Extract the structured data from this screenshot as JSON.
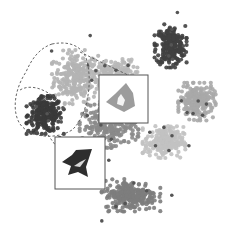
{
  "chart_data": {
    "type": "scatter",
    "title": "",
    "xlabel": "",
    "ylabel": "",
    "axes_visible": false,
    "grid": false,
    "legend": "none",
    "xlim": [
      0,
      100
    ],
    "ylim": [
      0,
      100
    ],
    "series": [
      {
        "name": "cluster-light-upper-left",
        "color": "#b4b4b4",
        "center": [
          30,
          69
        ],
        "spread": [
          9,
          10
        ],
        "count": 260
      },
      {
        "name": "cluster-dark-left",
        "color": "#3a3a3a",
        "center": [
          16,
          52
        ],
        "spread": [
          7,
          7
        ],
        "count": 240
      },
      {
        "name": "cluster-dark-top-right",
        "color": "#404040",
        "center": [
          73,
          83
        ],
        "spread": [
          6,
          8
        ],
        "count": 240
      },
      {
        "name": "cluster-light-top-middle",
        "color": "#b8b8b8",
        "center": [
          47,
          70
        ],
        "spread": [
          9,
          6
        ],
        "count": 200
      },
      {
        "name": "cluster-mid-center",
        "color": "#8a8a8a",
        "center": [
          45,
          47
        ],
        "spread": [
          11,
          8
        ],
        "count": 260
      },
      {
        "name": "cluster-mid-right",
        "color": "#a9a9a9",
        "center": [
          85,
          58
        ],
        "spread": [
          7,
          7
        ],
        "count": 220
      },
      {
        "name": "cluster-light-lower-right",
        "color": "#c2c2c2",
        "center": [
          70,
          40
        ],
        "spread": [
          8,
          6
        ],
        "count": 220
      },
      {
        "name": "cluster-mid-bottom",
        "color": "#7d7d7d",
        "center": [
          55,
          16
        ],
        "spread": [
          11,
          6
        ],
        "count": 260
      }
    ],
    "annotations": [
      {
        "type": "dashed-ellipse",
        "encloses": [
          "cluster-light-upper-left",
          "cluster-dark-left"
        ]
      },
      {
        "type": "inset",
        "name": "inset-upper",
        "depicts": "light gray star-shaped object",
        "linked_to": "dashed-ellipse"
      },
      {
        "type": "inset",
        "name": "inset-lower",
        "depicts": "dark star-shaped object",
        "linked_to": "cluster-dark-left"
      }
    ]
  },
  "colors": {
    "ellipse": "#555555",
    "inset_border": "#555555",
    "inset_star_light": "#9c9c9c",
    "inset_star_dark": "#2e2e2e"
  }
}
